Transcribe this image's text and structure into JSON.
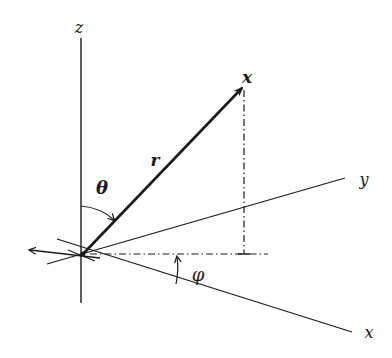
{
  "diagram": {
    "colors": {
      "line": "#1a1a1a",
      "background": "#ffffff"
    },
    "labels": {
      "z_axis": "z",
      "y_axis": "y",
      "x_axis": "x",
      "point": "x",
      "radius": "r",
      "theta": "θ",
      "phi": "φ"
    },
    "geometry": {
      "origin": [
        83,
        254
      ],
      "point": [
        244,
        85
      ],
      "projection_foot": [
        244,
        254
      ]
    }
  }
}
